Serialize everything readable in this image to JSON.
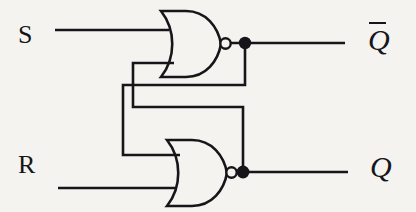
{
  "figure": {
    "kind": "logic-circuit-diagram",
    "name": "NOR-based SR latch",
    "background_color": "#f4f3ef",
    "ink_color": "#16161a",
    "width": 416,
    "height": 212
  },
  "labels": {
    "set_input": "S",
    "reset_input": "R",
    "q_output": "Q",
    "qbar_output": "Q"
  },
  "gates": [
    {
      "id": "nor-gate-top",
      "type": "NOR",
      "inputs": [
        "S",
        "feedback-from-Q"
      ],
      "output": "Q-bar",
      "body": {
        "x": 160,
        "y": 10,
        "width": 56,
        "height": 68
      },
      "bubble": {
        "cx": 221,
        "cy": 43,
        "r": 5
      },
      "junction_dot": {
        "cx": 245,
        "cy": 43,
        "r": 6
      }
    },
    {
      "id": "nor-gate-bottom",
      "type": "NOR",
      "inputs": [
        "feedback-from-Q-bar",
        "R"
      ],
      "output": "Q",
      "body": {
        "x": 166,
        "y": 139,
        "width": 56,
        "height": 68
      },
      "bubble": {
        "cx": 228,
        "cy": 172,
        "r": 5
      },
      "junction_dot": {
        "cx": 243,
        "cy": 172,
        "r": 6
      }
    }
  ],
  "wires": [
    {
      "id": "wire-s-input",
      "from": "S",
      "to": "nor-gate-top.input-1"
    },
    {
      "id": "wire-r-input",
      "from": "R",
      "to": "nor-gate-bottom.input-2"
    },
    {
      "id": "wire-qbar-out",
      "from": "nor-gate-top.output",
      "to": "Q-bar"
    },
    {
      "id": "wire-q-out",
      "from": "nor-gate-bottom.output",
      "to": "Q"
    },
    {
      "id": "wire-feedback-qbar-to-bottom",
      "from": "nor-gate-top.output",
      "to": "nor-gate-bottom.input-1"
    },
    {
      "id": "wire-feedback-q-to-top",
      "from": "nor-gate-bottom.output",
      "to": "nor-gate-top.input-2"
    }
  ]
}
